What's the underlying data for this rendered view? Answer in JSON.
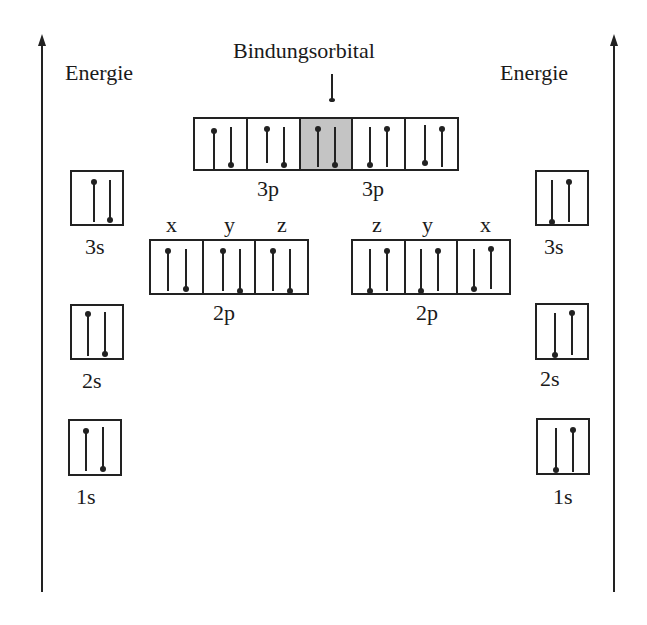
{
  "title": "Bindungsorbital",
  "axes": {
    "left_label": "Energie",
    "right_label": "Energie"
  },
  "left_atom": {
    "levels": [
      {
        "label": "3s",
        "spins": [
          "up",
          "down"
        ]
      },
      {
        "label": "2s",
        "spins": [
          "up",
          "down"
        ]
      },
      {
        "label": "1s",
        "spins": [
          "up",
          "down"
        ]
      }
    ],
    "p2": {
      "label": "2p",
      "axes": [
        "x",
        "y",
        "z"
      ],
      "cells": [
        [
          "up",
          "down"
        ],
        [
          "up",
          "down"
        ],
        [
          "up",
          "down"
        ]
      ]
    }
  },
  "right_atom": {
    "levels": [
      {
        "label": "3s",
        "spins": [
          "down",
          "up"
        ]
      },
      {
        "label": "2s",
        "spins": [
          "down",
          "up"
        ]
      },
      {
        "label": "1s",
        "spins": [
          "down",
          "up"
        ]
      }
    ],
    "p2": {
      "label": "2p",
      "axes": [
        "z",
        "y",
        "x"
      ],
      "cells": [
        [
          "down",
          "up"
        ],
        [
          "down",
          "up"
        ],
        [
          "down",
          "up"
        ]
      ]
    }
  },
  "p3": {
    "left_label": "3p",
    "right_label": "3p",
    "cells": [
      {
        "spins": [
          "up",
          "down"
        ],
        "shaded": false
      },
      {
        "spins": [
          "up",
          "down"
        ],
        "shaded": false
      },
      {
        "spins": [
          "up",
          "down"
        ],
        "shaded": true
      },
      {
        "spins": [
          "down",
          "up"
        ],
        "shaded": false
      },
      {
        "spins": [
          "down",
          "up"
        ],
        "shaded": false
      }
    ]
  },
  "colors": {
    "line": "#222222",
    "bonding_fill": "#c4c4c4",
    "background": "#ffffff"
  }
}
